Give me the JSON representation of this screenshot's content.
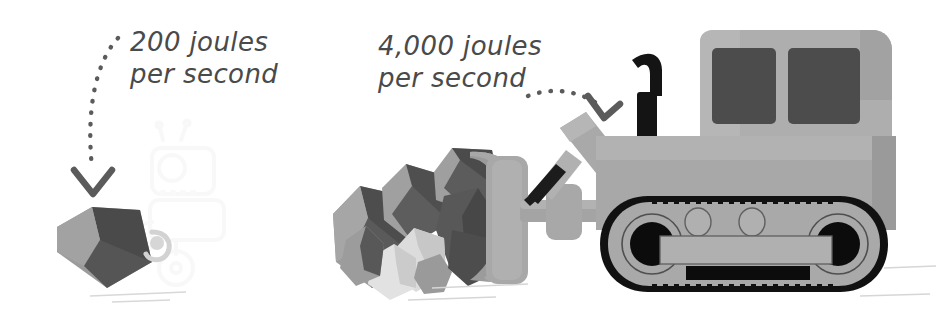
{
  "figure": {
    "background_color": "#ffffff",
    "style": "grayscale hand-drawn textbook illustration"
  },
  "labels": {
    "left": {
      "line1": "200 joules",
      "line2": "per second",
      "color": "#4a4a4a",
      "points_to": "hand-shovel-rock"
    },
    "right": {
      "line1": "4,000 joules",
      "line2": "per second",
      "color": "#4a4a4a",
      "points_to": "bulldozer-blade"
    }
  },
  "annotations": {
    "left_arrow": {
      "name": "dotted-arrow-down",
      "style": "dotted curved arrow with chevron head pointing down",
      "color": "#5b5b5b"
    },
    "right_arrow": {
      "name": "dotted-arrow-right",
      "style": "dotted curved arrow with chevron head pointing down-right",
      "color": "#5b5b5b"
    }
  },
  "palette": {
    "ink": "#4a4a4a",
    "arrow": "#5b5b5b",
    "rock_light": "#d9d9d9",
    "rock_mid": "#9b9b9b",
    "rock_dark": "#585858",
    "rock_darkest": "#414141",
    "machine_body": "#a9a9a9",
    "machine_body_light": "#b5b5b5",
    "machine_shadow": "#8f8f8f",
    "window_dark": "#4c4c4c",
    "track_black": "#111111",
    "ghost": "#cfcfcf"
  },
  "scene": {
    "left_subject": {
      "name": "hand-shovel-rock",
      "description": "single small boulder being moved by hand, faint ghost outline of a person with shovel behind"
    },
    "right_subject": {
      "name": "bulldozer",
      "description": "tracked bulldozer pushing a pile of boulders with its blade",
      "parts": [
        "blade",
        "hydraulic-arm",
        "exhaust-stack",
        "cab",
        "windows",
        "track",
        "drive-wheels",
        "rollers"
      ]
    },
    "boulders_left_count": 1,
    "boulders_right_count": 9
  }
}
